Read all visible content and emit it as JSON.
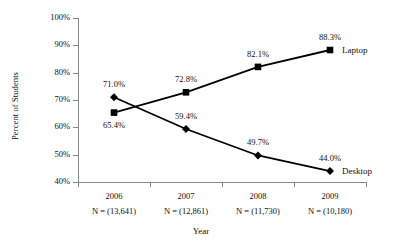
{
  "chart_data": {
    "type": "line",
    "title": "",
    "xlabel": "Year",
    "ylabel": "Percent of Students",
    "ylim": [
      40,
      100
    ],
    "ytick_labels": [
      "100%",
      "90%",
      "80%",
      "70%",
      "60%",
      "50%",
      "40%"
    ],
    "ytick_values": [
      100,
      90,
      80,
      70,
      60,
      50,
      40
    ],
    "grid": false,
    "legend_position": "right-inline-end-of-series",
    "categories": [
      "2006",
      "2007",
      "2008",
      "2009"
    ],
    "sample_sizes": [
      "N = (13,641)",
      "N = (12,861)",
      "N = (11,730)",
      "N = (10,180)"
    ],
    "series": [
      {
        "name": "Laptop",
        "marker": "square",
        "color": "#000000",
        "values": [
          65.4,
          72.8,
          82.1,
          88.3
        ],
        "data_labels": [
          "65.4%",
          "72.8%",
          "82.1%",
          "88.3%"
        ],
        "label_positions": [
          "below",
          "above",
          "above",
          "above"
        ]
      },
      {
        "name": "Desktop",
        "marker": "diamond",
        "color": "#000000",
        "values": [
          71.0,
          59.4,
          49.7,
          44.0
        ],
        "data_labels": [
          "71.0%",
          "59.4%",
          "49.7%",
          "44.0%"
        ],
        "label_positions": [
          "above",
          "above",
          "above",
          "above"
        ]
      }
    ]
  },
  "axis": {
    "line_color": "#8a8a8a"
  }
}
